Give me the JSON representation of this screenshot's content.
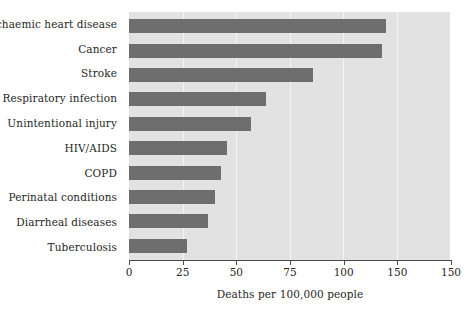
{
  "chart_data": {
    "type": "bar",
    "orientation": "horizontal",
    "title": "",
    "xlabel": "Deaths per 100,000 people",
    "ylabel": "",
    "xlim": [
      0,
      150
    ],
    "xticks": [
      0,
      25,
      50,
      75,
      100,
      125,
      150
    ],
    "xtick_labels": [
      "0",
      "25",
      "50",
      "75",
      "100",
      "150",
      "150"
    ],
    "grid": true,
    "legend": null,
    "categories": [
      "Ischaemic heart disease",
      "Cancer",
      "Stroke",
      "Respiratory infection",
      "Unintentional injury",
      "HIV/AIDS",
      "COPD",
      "Perinatal conditions",
      "Diarrheal diseases",
      "Tuberculosis"
    ],
    "values": [
      120,
      118,
      86,
      64,
      57,
      46,
      43,
      40,
      37,
      27
    ],
    "colors": {
      "bar": "#6e6e6e",
      "plot_background": "#e2e2e2",
      "gridline": "#f4f4f4",
      "axis": "#4a4a4a",
      "text": "#262626",
      "page_background": "#ffffff"
    }
  }
}
